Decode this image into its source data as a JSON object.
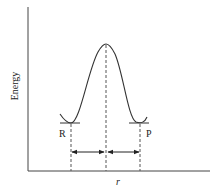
{
  "diagram": {
    "type": "potential-energy-curve",
    "y_axis_label": "Energy",
    "x_axis_label": "r",
    "labels": {
      "reactant": "R",
      "product": "P"
    },
    "colors": {
      "line": "#333333",
      "background": "#ffffff"
    },
    "features": [
      "reactant minimum (R)",
      "transition-state maximum",
      "product minimum (P)",
      "dashed vertical lines at R, maximum, and P",
      "double-headed arrows spanning R-to-maximum and maximum-to-P"
    ]
  }
}
